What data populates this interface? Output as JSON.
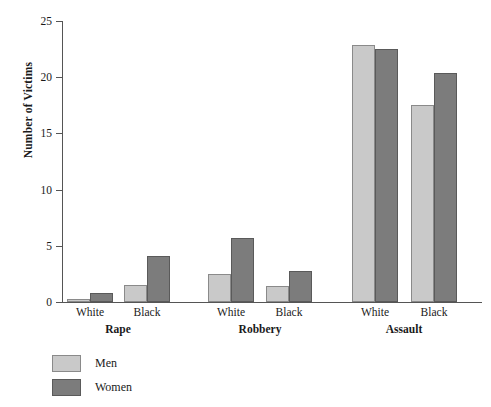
{
  "chart_data": {
    "type": "bar",
    "title": "",
    "xlabel": "",
    "ylabel": "Number of Victims",
    "ylim": [
      0,
      25
    ],
    "yticks": [
      0,
      5,
      10,
      15,
      20,
      25
    ],
    "ytick_labels": [
      "0",
      "5",
      "10",
      "15",
      "20",
      "25"
    ],
    "grid": false,
    "legend_position": "bottom-left",
    "groups": [
      {
        "label": "Rape",
        "categories": [
          "White",
          "Black"
        ]
      },
      {
        "label": "Robbery",
        "categories": [
          "White",
          "Black"
        ]
      },
      {
        "label": "Assault",
        "categories": [
          "White",
          "Black"
        ]
      }
    ],
    "categories": [
      "Rape - White",
      "Rape - Black",
      "Robbery - White",
      "Robbery - Black",
      "Assault - White",
      "Assault - Black"
    ],
    "series": [
      {
        "name": "Men",
        "color": "#c9c9c9",
        "values": [
          0.3,
          1.5,
          2.5,
          1.4,
          22.9,
          17.5
        ]
      },
      {
        "name": "Women",
        "color": "#7c7c7c",
        "values": [
          0.8,
          4.1,
          5.7,
          2.8,
          22.5,
          20.4
        ]
      }
    ]
  },
  "legend": {
    "items": [
      {
        "label": "Men",
        "color": "#c9c9c9"
      },
      {
        "label": "Women",
        "color": "#7c7c7c"
      }
    ]
  }
}
